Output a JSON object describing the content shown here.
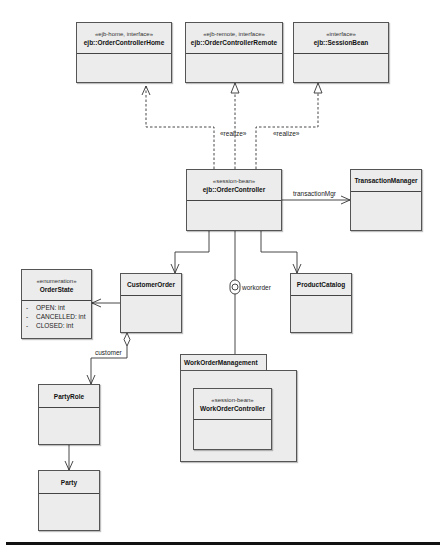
{
  "diagram": {
    "type": "UML class diagram",
    "classes": {
      "order_controller_home": {
        "stereotype": "«ejb-home, interface»",
        "name": "ejb::OrderControllerHome"
      },
      "order_controller_remote": {
        "stereotype": "«ejb-remote, interface»",
        "name": "ejb::OrderControllerRemote"
      },
      "session_bean": {
        "stereotype": "«interface»",
        "name": "ejb::SessionBean"
      },
      "order_controller": {
        "stereotype": "«session-bean»",
        "name": "ejb::OrderController"
      },
      "transaction_manager": {
        "name": "TransactionManager"
      },
      "order_state": {
        "stereotype": "«enumeration»",
        "name": "OrderState",
        "attributes": [
          {
            "visibility": "-",
            "text": "OPEN:  int"
          },
          {
            "visibility": "-",
            "text": "CANCELLED:  int"
          },
          {
            "visibility": "-",
            "text": "CLOSED:  int"
          }
        ]
      },
      "customer_order": {
        "name": "CustomerOrder"
      },
      "product_catalog": {
        "name": "ProductCatalog"
      },
      "party_role": {
        "name": "PartyRole"
      },
      "party": {
        "name": "Party"
      },
      "work_order_controller": {
        "stereotype": "«session-bean»",
        "name": "WorkOrderController"
      }
    },
    "packages": {
      "work_order_management": {
        "name": "WorkOrderManagement"
      }
    },
    "edge_labels": {
      "realize_1": "«realize»",
      "realize_2": "«realize»",
      "transaction_mgr": "transactionMgr",
      "workorder": "workorder",
      "customer": "customer"
    },
    "relationships": [
      {
        "from": "ejb::OrderController",
        "to": "ejb::OrderControllerHome",
        "kind": "dependency"
      },
      {
        "from": "ejb::OrderController",
        "to": "ejb::OrderControllerRemote",
        "kind": "realization",
        "label": "«realize»"
      },
      {
        "from": "ejb::OrderController",
        "to": "ejb::SessionBean",
        "kind": "realization",
        "label": "«realize»"
      },
      {
        "from": "ejb::OrderController",
        "to": "TransactionManager",
        "kind": "association",
        "label": "transactionMgr"
      },
      {
        "from": "ejb::OrderController",
        "to": "CustomerOrder",
        "kind": "association"
      },
      {
        "from": "ejb::OrderController",
        "to": "ProductCatalog",
        "kind": "association"
      },
      {
        "from": "ejb::OrderController",
        "to": "WorkOrderManagement",
        "kind": "required-interface",
        "label": "workorder"
      },
      {
        "from": "CustomerOrder",
        "to": "OrderState",
        "kind": "association"
      },
      {
        "from": "CustomerOrder",
        "to": "PartyRole",
        "kind": "aggregation",
        "label": "customer"
      },
      {
        "from": "PartyRole",
        "to": "Party",
        "kind": "association"
      }
    ],
    "colors": {
      "box_fill": "#ececec",
      "line": "#333333",
      "background": "#ffffff"
    }
  }
}
